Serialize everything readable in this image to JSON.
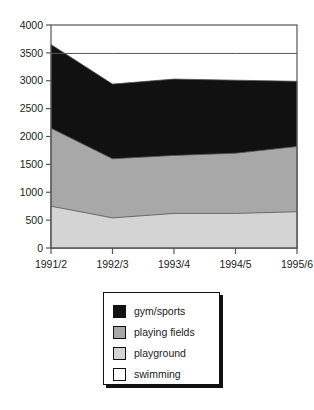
{
  "chart_data": {
    "type": "area",
    "stacked": true,
    "title": "",
    "xlabel": "",
    "ylabel": "",
    "categories": [
      "1991/2",
      "1992/3",
      "1993/4",
      "1994/5",
      "1995/6"
    ],
    "ylim": [
      0,
      4000
    ],
    "ytick_step": 500,
    "ytick_labels": [
      "0",
      "500",
      "1000",
      "1500",
      "2000",
      "2500",
      "3000",
      "3500",
      "4000"
    ],
    "ytick_values": [
      0,
      500,
      1000,
      1500,
      2000,
      2500,
      3000,
      3500,
      4000
    ],
    "grid": false,
    "legend_position": "bottom",
    "series": [
      {
        "name": "gym/sports",
        "color": "#111111",
        "values": [
          1500,
          1340,
          1370,
          1310,
          1170
        ],
        "cumulative_top": [
          3650,
          2940,
          3030,
          3010,
          2990
        ]
      },
      {
        "name": "playing fields",
        "color": "#a8a8a8",
        "values": [
          1400,
          1060,
          1040,
          1080,
          1170
        ],
        "cumulative_top": [
          2150,
          1600,
          1660,
          1700,
          1820
        ]
      },
      {
        "name": "playground",
        "color": "#d4d4d4",
        "values": [
          750,
          540,
          620,
          620,
          650
        ],
        "cumulative_top": [
          750,
          540,
          620,
          620,
          650
        ]
      },
      {
        "name": "swimming",
        "color": "#ffffff",
        "values": [
          -160,
          550,
          460,
          480,
          500
        ],
        "cumulative_top": [
          3490,
          3490,
          3490,
          3490,
          3490
        ]
      }
    ]
  },
  "legend": {
    "items": [
      {
        "label": "gym/sports",
        "color": "#111111"
      },
      {
        "label": "playing fields",
        "color": "#a8a8a8"
      },
      {
        "label": "playground",
        "color": "#d4d4d4"
      },
      {
        "label": "swimming",
        "color": "#ffffff"
      }
    ]
  },
  "axes": {
    "frame_color": "#555555",
    "tick_color": "#555555"
  }
}
